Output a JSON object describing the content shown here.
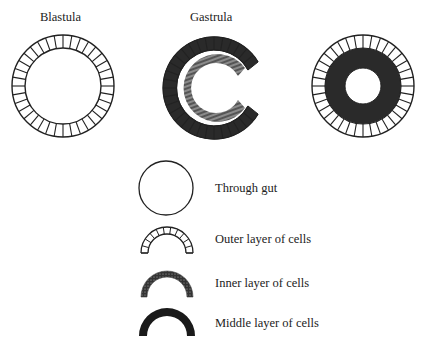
{
  "titles": {
    "blastula": "Blastula",
    "gastrula": "Gastrula"
  },
  "figures": [
    {
      "name": "blastula",
      "description": "single outer layer of cells around hollow center"
    },
    {
      "name": "gastrula",
      "description": "C-shaped invagination with outer and inner layers"
    },
    {
      "name": "three-layer-embryo",
      "description": "outer layer, middle layer, through gut"
    }
  ],
  "legend": [
    {
      "label": "Through gut",
      "symbol": "open-circle"
    },
    {
      "label": "Outer layer of cells",
      "symbol": "segmented-arc"
    },
    {
      "label": "Inner layer of cells",
      "symbol": "speckled-arc"
    },
    {
      "label": "Middle layer of cells",
      "symbol": "solid-arc"
    }
  ],
  "colors": {
    "stroke": "#222222",
    "fill_dark": "#2a2a2a",
    "background": "#ffffff"
  }
}
